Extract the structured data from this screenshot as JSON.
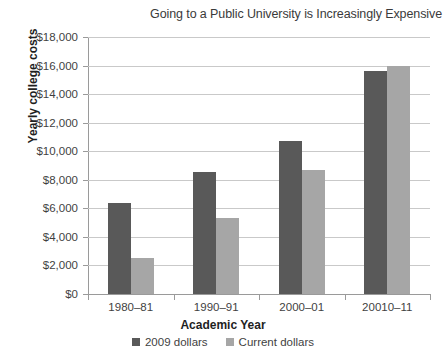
{
  "chart_data": {
    "type": "bar",
    "title": "Going to a Public University is Increasingly Expensive",
    "xlabel": "Academic Year",
    "ylabel": "Yearly college costs",
    "categories": [
      "1980–81",
      "1990–91",
      "2000–01",
      "20010–11"
    ],
    "series": [
      {
        "name": "2009 dollars",
        "color": "#595959",
        "values": [
          6350,
          8550,
          10700,
          15650
        ]
      },
      {
        "name": "Current dollars",
        "color": "#a6a6a6",
        "values": [
          2550,
          5300,
          8700,
          15950
        ]
      }
    ],
    "ylim": [
      0,
      18000
    ],
    "ytick_step": 2000,
    "ytick_labels": [
      "$0",
      "$2,000",
      "$4,000",
      "$6,000",
      "$8,000",
      "$10,000",
      "$12,000",
      "$14,000",
      "$16,000",
      "$18,000"
    ],
    "ytick_values": [
      0,
      2000,
      4000,
      6000,
      8000,
      10000,
      12000,
      14000,
      16000,
      18000
    ],
    "grid": true,
    "legend_position": "bottom"
  }
}
